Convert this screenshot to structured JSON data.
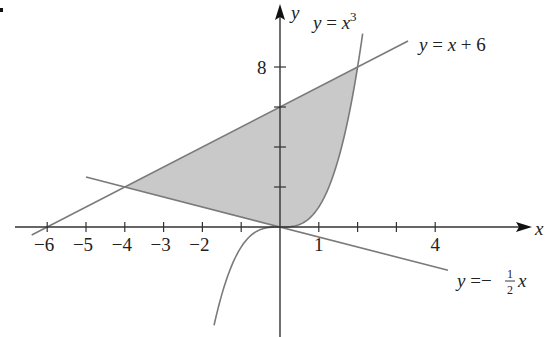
{
  "figure": {
    "axes": {
      "x_label": "x",
      "y_label": "y",
      "x_tick_labels": [
        {
          "value": -6,
          "text": "−6"
        },
        {
          "value": -5,
          "text": "−5"
        },
        {
          "value": -4,
          "text": "−4"
        },
        {
          "value": -3,
          "text": "−3"
        },
        {
          "value": -2,
          "text": "−2"
        },
        {
          "value": 1,
          "text": "1"
        },
        {
          "value": 4,
          "text": "4"
        }
      ],
      "x_ticks": [
        -6,
        -5,
        -4,
        -3,
        -2,
        -1,
        1,
        2,
        3,
        4
      ],
      "y_tick_labels": [
        {
          "value": 8,
          "text": "8"
        }
      ],
      "y_ticks": [
        2,
        4,
        6,
        8
      ]
    },
    "curves": [
      {
        "id": "cubic",
        "equation": "y = x^3",
        "label_lhs": "y",
        "label_eq": " = ",
        "label_var": "x",
        "label_exp": "3"
      },
      {
        "id": "line1",
        "equation": "y = x + 6",
        "label_lhs": "y",
        "label_eq": " = ",
        "label_var": "x",
        "label_rest": " + 6"
      },
      {
        "id": "line2",
        "equation": "y = -1/2 x",
        "label_lhs": "y",
        "label_eq": " =−",
        "label_num": "1",
        "label_den": "2",
        "label_var": "x"
      }
    ],
    "shaded_region": {
      "description": "Region bounded by y = x + 6, y = x^3, and y = -1/2 x",
      "vertices": [
        [
          -4,
          2
        ],
        [
          2,
          8
        ],
        [
          0,
          0
        ]
      ],
      "fill": "#c9c9c9"
    },
    "colors": {
      "axis": "#333333",
      "curve": "#7a7a7a",
      "shade": "#c9c9c9",
      "text": "#222222"
    }
  }
}
